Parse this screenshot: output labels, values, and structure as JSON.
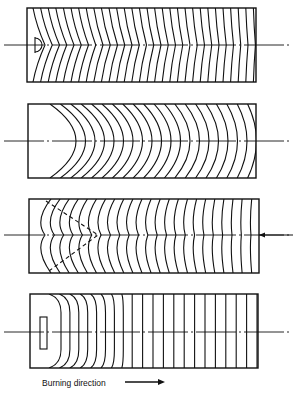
{
  "figure": {
    "caption": "Burning direction",
    "caption_arrow": "right-arrow",
    "line_color": "#111111",
    "background": "#ffffff",
    "panels": [
      {
        "id": 1,
        "description": "Small semicircular ignition cavity at left end, fronts curve convex to the right and flatten",
        "axis_y": 45,
        "rect": [
          27,
          8,
          229,
          74
        ],
        "front_count": 30
      },
      {
        "id": 2,
        "description": "Large concave left face, uniform arc fronts progressing right",
        "axis_y": 141,
        "rect": [
          28,
          104,
          228,
          74
        ],
        "front_count": 22
      },
      {
        "id": 3,
        "description": "V-shaped dashed boundary from left, chevron fronts, arrow entering at right end",
        "axis_y": 235,
        "rect": [
          29,
          199,
          230,
          74
        ],
        "front_count": 24
      },
      {
        "id": 4,
        "description": "Rectangular slot at left end, D-shaped fronts straightening to vertical",
        "axis_y": 332,
        "rect": [
          30,
          294,
          228,
          74
        ],
        "front_count": 22
      }
    ]
  }
}
